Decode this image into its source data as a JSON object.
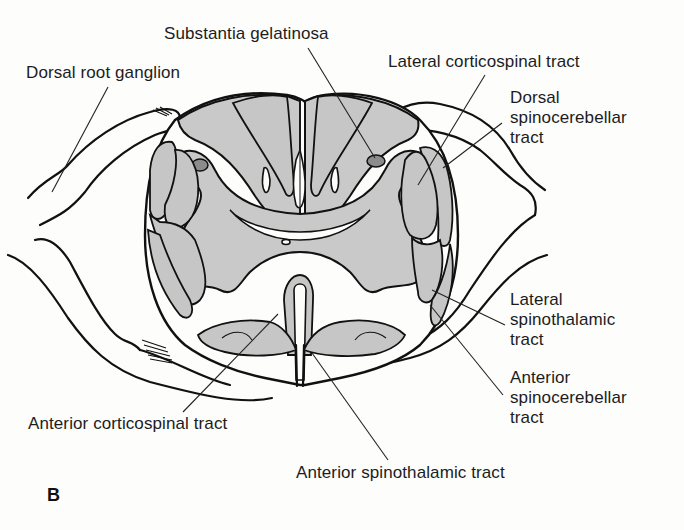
{
  "figure": {
    "panel_label": "B",
    "colors": {
      "background": "#fdfdfc",
      "tract_fill": "#c6c6c6",
      "grey_matter_fill": "#c9c9c9",
      "outline": "#111111"
    }
  },
  "labels": {
    "substantia_gelatinosa": {
      "lines": [
        "Substantia gelatinosa"
      ]
    },
    "dorsal_root_ganglion": {
      "lines": [
        "Dorsal root ganglion"
      ]
    },
    "lateral_corticospinal": {
      "lines": [
        "Lateral corticospinal tract"
      ]
    },
    "dorsal_spinocerebellar": {
      "lines": [
        "Dorsal",
        "spinocerebellar",
        "tract"
      ]
    },
    "lateral_spinothalamic": {
      "lines": [
        "Lateral",
        "spinothalamic",
        "tract"
      ]
    },
    "anterior_spinocerebellar": {
      "lines": [
        "Anterior",
        "spinocerebellar",
        "tract"
      ]
    },
    "anterior_corticospinal": {
      "lines": [
        "Anterior corticospinal tract"
      ]
    },
    "anterior_spinothalamic": {
      "lines": [
        "Anterior spinothalamic tract"
      ]
    }
  }
}
